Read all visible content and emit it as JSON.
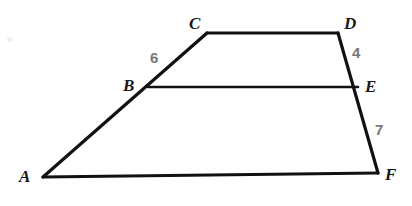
{
  "figure": {
    "background_color": "#ffffff",
    "stroke_color": "#111113",
    "vertex_label_color": "#17181a",
    "measure_label_color": "#76787b"
  },
  "vertices": [
    {
      "name": "A",
      "label": "A",
      "x": 43,
      "y": 177,
      "label_x": 19,
      "label_y": 169
    },
    {
      "name": "B",
      "label": "B",
      "x": 148,
      "y": 87,
      "label_x": 123,
      "label_y": 77
    },
    {
      "name": "C",
      "label": "C",
      "x": 207,
      "y": 33,
      "label_x": 189,
      "label_y": 15
    },
    {
      "name": "D",
      "label": "D",
      "x": 338,
      "y": 33,
      "label_x": 344,
      "label_y": 15
    },
    {
      "name": "E",
      "label": "E",
      "x": 358,
      "y": 87,
      "label_x": 365,
      "label_y": 78
    },
    {
      "name": "F",
      "label": "F",
      "x": 378,
      "y": 173,
      "label_x": 385,
      "label_y": 168
    }
  ],
  "segments": [
    {
      "name": "segment-A-C",
      "from": "A",
      "to": "C"
    },
    {
      "name": "segment-C-D",
      "from": "C",
      "to": "D"
    },
    {
      "name": "segment-D-F",
      "from": "D",
      "to": "F"
    },
    {
      "name": "segment-A-F",
      "from": "A",
      "to": "F"
    },
    {
      "name": "segment-B-E",
      "from": "B",
      "to": "E"
    }
  ],
  "measures": [
    {
      "name": "measure-BC",
      "segment": "B-C",
      "value": "6",
      "x": 150,
      "y": 50
    },
    {
      "name": "measure-DE",
      "segment": "D-E",
      "value": "4",
      "x": 352,
      "y": 45
    },
    {
      "name": "measure-EF",
      "segment": "E-F",
      "value": "7",
      "x": 375,
      "y": 122
    }
  ]
}
